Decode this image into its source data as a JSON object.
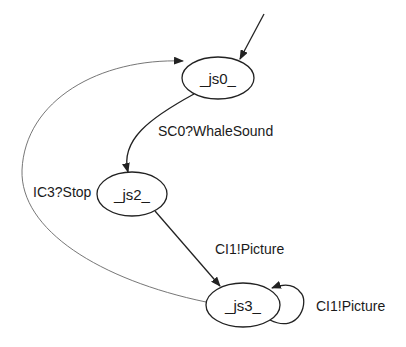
{
  "diagram": {
    "type": "state-machine",
    "nodes": [
      {
        "id": "js0",
        "label": "_js0_",
        "cx": 218,
        "cy": 78,
        "rx": 36,
        "ry": 21,
        "initial": true
      },
      {
        "id": "js2",
        "label": "_js2_",
        "cx": 132,
        "cy": 194,
        "rx": 35,
        "ry": 22
      },
      {
        "id": "js3",
        "label": "_js3_",
        "cx": 243,
        "cy": 305,
        "rx": 37,
        "ry": 22
      }
    ],
    "edges": [
      {
        "from": "js0",
        "to": "js2",
        "label": "SC0?WhaleSound"
      },
      {
        "from": "js2",
        "to": "js3",
        "label": "CI1!Picture"
      },
      {
        "from": "js3",
        "to": "js3",
        "label": "CI1!Picture"
      },
      {
        "from": "js3",
        "to": "js0",
        "label": "IC3?Stop"
      }
    ]
  },
  "colors": {
    "stroke": "#222222",
    "thin_stroke": "#555555",
    "background": "#ffffff"
  }
}
